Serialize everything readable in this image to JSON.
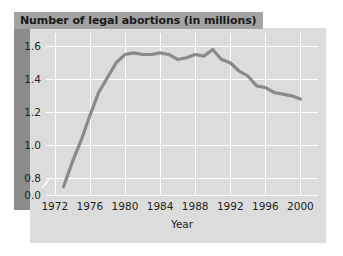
{
  "figure": {
    "title": "Number of legal abortions (in millions)",
    "accent_panel_color": "#dcdcdc",
    "band_color": "#8c8c8c",
    "title_banner_color": "#a3a3a3",
    "line_color": "#8a8a8a",
    "gridline_color": "#ffffff"
  },
  "chart_data": {
    "type": "line",
    "title": "Number of legal abortions (in millions)",
    "xlabel": "Year",
    "ylabel": "",
    "xlim": [
      1971,
      2002
    ],
    "ylim": [
      0.7,
      1.68
    ],
    "grid": true,
    "legend": "none",
    "axis_break": true,
    "y_ticks": [
      "0.0",
      "0.8",
      "1.0",
      "1.2",
      "1.4",
      "1.6"
    ],
    "y_tick_values": [
      0.7,
      0.8,
      1.0,
      1.2,
      1.4,
      1.6
    ],
    "x_ticks": [
      "1972",
      "1976",
      "1980",
      "1984",
      "1988",
      "1992",
      "1996",
      "2000"
    ],
    "x_tick_values": [
      1972,
      1976,
      1980,
      1984,
      1988,
      1992,
      1996,
      2000
    ],
    "series": [
      {
        "name": "Number of legal abortions (in millions)",
        "x": [
          1973,
          1974,
          1975,
          1976,
          1977,
          1978,
          1979,
          1980,
          1981,
          1982,
          1983,
          1984,
          1985,
          1986,
          1987,
          1988,
          1989,
          1990,
          1991,
          1992,
          1993,
          1994,
          1995,
          1996,
          1997,
          1998,
          1999,
          2000
        ],
        "values": [
          0.75,
          0.9,
          1.03,
          1.18,
          1.32,
          1.41,
          1.5,
          1.55,
          1.56,
          1.55,
          1.55,
          1.56,
          1.55,
          1.52,
          1.53,
          1.55,
          1.54,
          1.58,
          1.52,
          1.5,
          1.45,
          1.42,
          1.36,
          1.35,
          1.32,
          1.31,
          1.3,
          1.28
        ]
      }
    ]
  }
}
